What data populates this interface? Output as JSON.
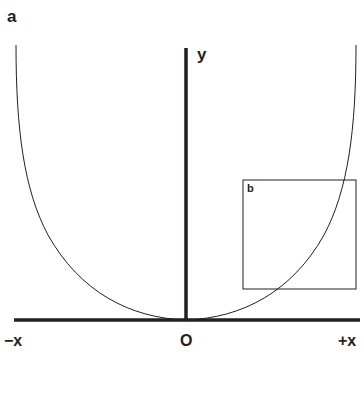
{
  "figure": {
    "panel_label": "a",
    "axes": {
      "y_label": "y",
      "x_neg_label": "−x",
      "origin_label": "O",
      "x_pos_label": "+x"
    },
    "inset": {
      "label": "b"
    },
    "colors": {
      "ink": "#231f20",
      "background": "#ffffff"
    }
  }
}
